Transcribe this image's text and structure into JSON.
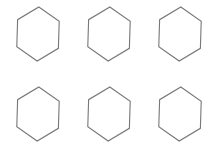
{
  "canvas": {
    "width": 219,
    "height": 158,
    "background": "#ffffff"
  },
  "style": {
    "stroke": "#777777"
  },
  "hexagons": [
    {
      "row": 0,
      "col": 0,
      "cx": 38,
      "cy": 34,
      "r": 27,
      "rotation_deg": 2
    },
    {
      "row": 0,
      "col": 1,
      "cx": 109,
      "cy": 34,
      "r": 27,
      "rotation_deg": 2
    },
    {
      "row": 0,
      "col": 2,
      "cx": 180,
      "cy": 34,
      "r": 27,
      "rotation_deg": 2
    },
    {
      "row": 1,
      "col": 0,
      "cx": 38,
      "cy": 114,
      "r": 27,
      "rotation_deg": 2
    },
    {
      "row": 1,
      "col": 1,
      "cx": 109,
      "cy": 114,
      "r": 27,
      "rotation_deg": 2
    },
    {
      "row": 1,
      "col": 2,
      "cx": 180,
      "cy": 114,
      "r": 27,
      "rotation_deg": 2
    }
  ]
}
